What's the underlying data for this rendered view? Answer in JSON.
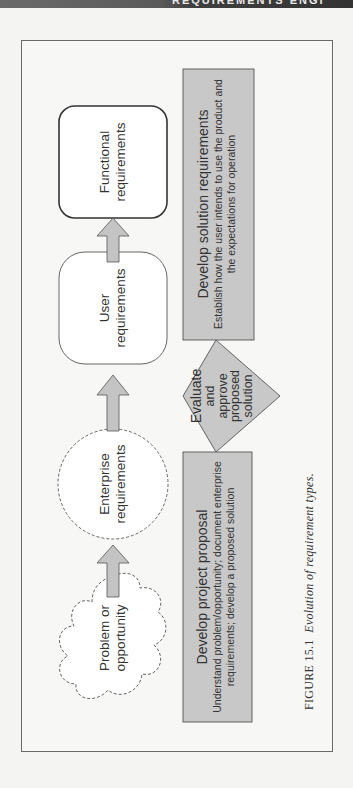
{
  "header": {
    "running_head": "REQUIREMENTS ENGI"
  },
  "diagram": {
    "nodes": [
      {
        "id": "functional",
        "label_line1": "Functional",
        "label_line2": "requirements",
        "shape": "rounded-rect-solid"
      },
      {
        "id": "user",
        "label_line1": "User",
        "label_line2": "requirements",
        "shape": "rounded-rect-thin"
      },
      {
        "id": "enterprise",
        "label_line1": "Enterprise",
        "label_line2": "requirements",
        "shape": "dashed-circle"
      },
      {
        "id": "problem",
        "label_line1": "Problem or",
        "label_line2": "opportunity",
        "shape": "dashed-cloud"
      }
    ],
    "process_boxes": [
      {
        "id": "solution",
        "title": "Develop solution requirements",
        "desc_line1": "Establish how the user intends to use the product and",
        "desc_line2": "the expectations for operation"
      },
      {
        "id": "proposal",
        "title": "Develop project proposal",
        "desc_line1": "Understand problem/opportunity; document enterprise",
        "desc_line2": "requirements; develop a proposed solution"
      }
    ],
    "decision": {
      "line1": "Evaluate",
      "line2": "and",
      "line3": "approve",
      "line4": "proposed",
      "line5": "solution"
    },
    "colors": {
      "process_fill": "#c8c8c8",
      "arrow_fill": "#c4c4c4",
      "stroke": "#555555"
    }
  },
  "caption": {
    "figure_number": "FIGURE 15.1",
    "text": "Evolution of requirement types."
  }
}
